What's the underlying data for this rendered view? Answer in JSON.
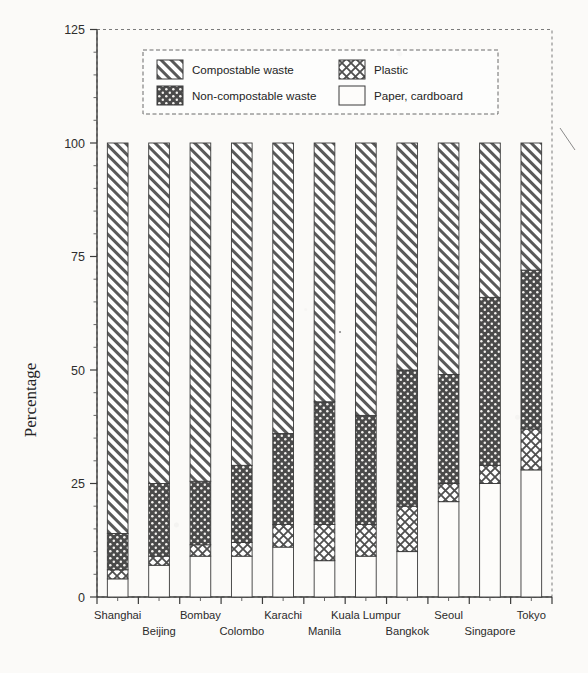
{
  "chart_data": {
    "type": "bar",
    "subtype": "stacked-bar-100",
    "title": "",
    "xlabel": "",
    "ylabel": "Percentage",
    "ylim": [
      0,
      125
    ],
    "yticks": [
      0,
      25,
      50,
      75,
      100,
      125
    ],
    "ytick_labels": [
      "0",
      "25",
      "50",
      "75",
      "100",
      "125"
    ],
    "grid": false,
    "legend_position": "top-inside",
    "categories": [
      "Shanghai",
      "Beijing",
      "Bombay",
      "Colombo",
      "Karachi",
      "Manila",
      "Kuala Lumpur",
      "Bangkok",
      "Seoul",
      "Singapore",
      "Tokyo"
    ],
    "series": [
      {
        "name": "Paper, cardboard",
        "pattern": "empty",
        "values": [
          4,
          7,
          9,
          9,
          11,
          8,
          9,
          10,
          21,
          25,
          28
        ]
      },
      {
        "name": "Plastic",
        "pattern": "crosshatch",
        "values": [
          2,
          2,
          2.5,
          3,
          5,
          8,
          7,
          10,
          4,
          4,
          9
        ]
      },
      {
        "name": "Non-compostable waste",
        "pattern": "dark-dots",
        "values": [
          8,
          16,
          14,
          17,
          20,
          27,
          24,
          30,
          24,
          37,
          35
        ]
      },
      {
        "name": "Compostable waste",
        "pattern": "diagonal-hatch",
        "values": [
          86,
          75,
          74.5,
          71,
          64,
          57,
          60,
          50,
          51,
          34,
          28
        ]
      }
    ]
  },
  "legend": {
    "entries": [
      {
        "label": "Compostable waste",
        "pattern": "diagonal-hatch"
      },
      {
        "label": "Plastic",
        "pattern": "crosshatch"
      },
      {
        "label": "Non-compostable waste",
        "pattern": "dark-dots"
      },
      {
        "label": "Paper, cardboard",
        "pattern": "empty"
      }
    ]
  },
  "colors": {
    "ink": "#2a2a2a",
    "dark_fill": "#4a4a4a",
    "light_fill": "#ffffff",
    "paper": "#fbfaf8"
  }
}
